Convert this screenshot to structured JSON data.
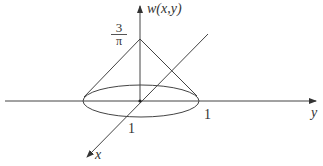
{
  "diagram": {
    "title": "",
    "axis_labels": {
      "vertical": "w(x,y)",
      "horizontal": "y",
      "diagonal": "x"
    },
    "tick_labels": {
      "y_one": "1",
      "x_one": "1"
    },
    "apex_label": {
      "numerator": "3",
      "denominator": "π"
    },
    "shape": "cone over unit disk",
    "colors": {
      "stroke": "#444444",
      "text": "#333333",
      "background": "#ffffff"
    }
  }
}
